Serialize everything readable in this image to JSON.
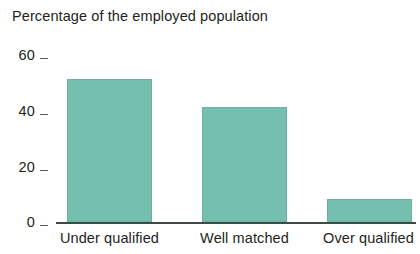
{
  "chart_data": {
    "type": "bar",
    "title": "Percentage of the employed population",
    "xlabel": "",
    "ylabel": "",
    "categories": [
      "Under qualified",
      "Well matched",
      "Over qualified"
    ],
    "values": [
      50,
      40,
      8
    ],
    "series": [
      {
        "name": "Percentage of the employed population",
        "values": [
          50,
          40,
          8
        ],
        "color": "#74bfae"
      }
    ],
    "ylim": [
      0,
      60
    ],
    "yticks": [
      0,
      20,
      40,
      60
    ],
    "ytick_labels": [
      "0",
      "20",
      "40",
      "60"
    ],
    "grid": false,
    "legend": false,
    "legend_position": "none",
    "bar_color": "#74bfae",
    "axis_color": "#3f4a45",
    "text_color": "#231f20",
    "background": "#ffffff"
  },
  "axis": {
    "y_ticks": [
      {
        "label": "60",
        "value": 60
      },
      {
        "label": "40",
        "value": 40
      },
      {
        "label": "20",
        "value": 20
      },
      {
        "label": "0",
        "value": 0
      }
    ],
    "x_categories": [
      {
        "label": "Under qualified"
      },
      {
        "label": "Well matched"
      },
      {
        "label": "Over qualified"
      }
    ]
  },
  "bars": [
    {
      "category": "Under qualified",
      "value": 50
    },
    {
      "category": "Well matched",
      "value": 40
    },
    {
      "category": "Over qualified",
      "value": 8
    }
  ]
}
